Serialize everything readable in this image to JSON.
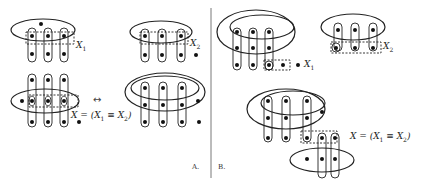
{
  "figure": {
    "panels": [
      {
        "id": "A",
        "label": "A.",
        "subfigures": [
          {
            "name": "top-left",
            "set_label": "X",
            "set_sub": "1"
          },
          {
            "name": "top-right",
            "set_label": "X",
            "set_sub": "2"
          },
          {
            "name": "bottom-left",
            "merged_label": "X = (X",
            "merged_sub1": "1",
            "merged_mid": " ≡ X",
            "merged_sub2": "2",
            "merged_end": ")"
          },
          {
            "name": "bottom-right"
          }
        ],
        "equivalence_arrow": "↔"
      },
      {
        "id": "B",
        "label": "B.",
        "subfigures": [
          {
            "name": "top-left",
            "set_label": "X",
            "set_sub": "1"
          },
          {
            "name": "top-right",
            "set_label": "X",
            "set_sub": "2"
          },
          {
            "name": "bottom",
            "merged_label": "X = (X",
            "merged_sub1": "1",
            "merged_mid": " ≡ X",
            "merged_sub2": "2",
            "merged_end": ")"
          }
        ]
      }
    ],
    "colors": {
      "stroke": "#222222",
      "background": "#ffffff"
    }
  }
}
